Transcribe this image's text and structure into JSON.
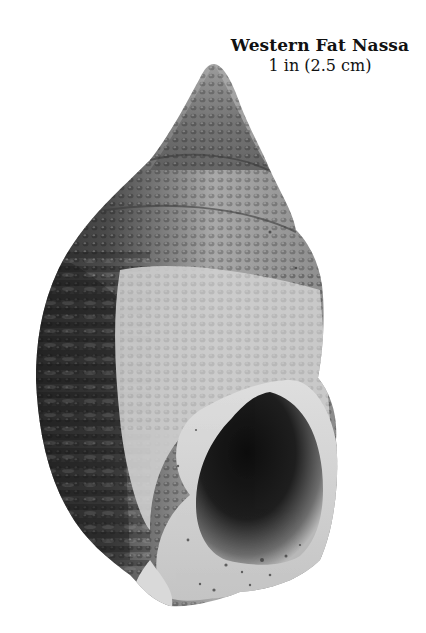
{
  "caption": {
    "title": "Western Fat Nassa",
    "size": "1 in (2.5 cm)"
  },
  "image": {
    "subject": "shell-photo",
    "palette": {
      "dark_ribs": "#2e2e2e",
      "mid_gray": "#7a7a7a",
      "light_body": "#cfcfcf",
      "aperture_dark": "#141414",
      "lip_light": "#e4e4e4",
      "background": "#ffffff"
    }
  }
}
